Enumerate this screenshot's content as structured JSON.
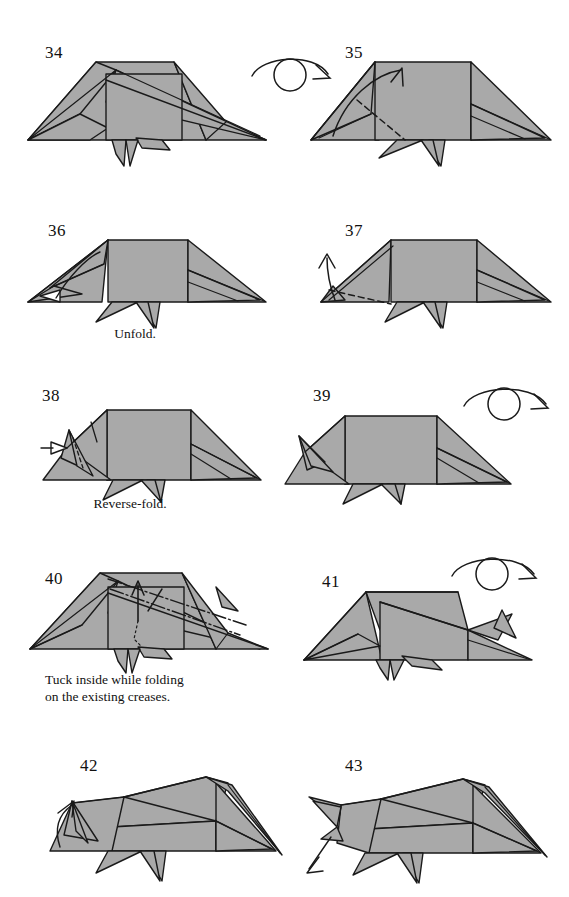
{
  "page": {
    "type": "origami-instruction-diagram",
    "model": "folded paper figure (side view)",
    "background_color": "#ffffff",
    "paper_fill_color": "#a9a9a9",
    "paper_shadow_color": "#8e8e8e",
    "line_color": "#1a1a1a",
    "text_color": "#111111",
    "columns": 2,
    "rows": 5
  },
  "steps": [
    {
      "number": "34",
      "number_pos": {
        "x": 45,
        "y": 44
      },
      "caption": "",
      "caption_pos": {
        "x": 0,
        "y": 0
      },
      "has_turnover_symbol": false,
      "figure_pos": {
        "x": 20,
        "y": 48
      },
      "figure_size": {
        "w": 250,
        "h": 120
      }
    },
    {
      "number": "35",
      "number_pos": {
        "x": 345,
        "y": 44
      },
      "caption": "",
      "caption_pos": {
        "x": 0,
        "y": 0
      },
      "has_turnover_symbol": true,
      "turnover_pos": {
        "x": 248,
        "y": 48
      },
      "figure_pos": {
        "x": 305,
        "y": 48
      },
      "figure_size": {
        "w": 250,
        "h": 120
      }
    },
    {
      "number": "36",
      "number_pos": {
        "x": 48,
        "y": 222
      },
      "caption": "Unfold.",
      "caption_pos": {
        "x": 85,
        "y": 326
      },
      "has_turnover_symbol": false,
      "figure_pos": {
        "x": 20,
        "y": 228
      },
      "figure_size": {
        "w": 250,
        "h": 100
      }
    },
    {
      "number": "37",
      "number_pos": {
        "x": 345,
        "y": 222
      },
      "caption": "",
      "caption_pos": {
        "x": 0,
        "y": 0
      },
      "has_turnover_symbol": false,
      "figure_pos": {
        "x": 305,
        "y": 228
      },
      "figure_size": {
        "w": 250,
        "h": 100
      }
    },
    {
      "number": "38",
      "number_pos": {
        "x": 42,
        "y": 387
      },
      "caption": "Reverse-fold.",
      "caption_pos": {
        "x": 60,
        "y": 496
      },
      "has_turnover_symbol": false,
      "figure_pos": {
        "x": 15,
        "y": 392
      },
      "figure_size": {
        "w": 255,
        "h": 110
      }
    },
    {
      "number": "39",
      "number_pos": {
        "x": 313,
        "y": 387
      },
      "caption": "",
      "caption_pos": {
        "x": 0,
        "y": 0
      },
      "has_turnover_symbol": true,
      "turnover_pos": {
        "x": 458,
        "y": 380
      },
      "figure_pos": {
        "x": 285,
        "y": 392
      },
      "figure_size": {
        "w": 260,
        "h": 110
      }
    },
    {
      "number": "40",
      "number_pos": {
        "x": 45,
        "y": 570
      },
      "caption": "Tuck inside while folding\non the existing creases.",
      "caption_pos": {
        "x": 45,
        "y": 672
      },
      "has_turnover_symbol": false,
      "figure_pos": {
        "x": 20,
        "y": 563
      },
      "figure_size": {
        "w": 255,
        "h": 110
      }
    },
    {
      "number": "41",
      "number_pos": {
        "x": 322,
        "y": 573
      },
      "caption": "",
      "caption_pos": {
        "x": 0,
        "y": 0
      },
      "has_turnover_symbol": true,
      "turnover_pos": {
        "x": 448,
        "y": 550
      },
      "figure_pos": {
        "x": 292,
        "y": 568
      },
      "figure_size": {
        "w": 260,
        "h": 110
      }
    },
    {
      "number": "42",
      "number_pos": {
        "x": 80,
        "y": 757
      },
      "caption": "",
      "caption_pos": {
        "x": 0,
        "y": 0
      },
      "has_turnover_symbol": false,
      "figure_pos": {
        "x": 20,
        "y": 755
      },
      "figure_size": {
        "w": 265,
        "h": 125
      }
    },
    {
      "number": "43",
      "number_pos": {
        "x": 345,
        "y": 757
      },
      "caption": "",
      "caption_pos": {
        "x": 0,
        "y": 0
      },
      "has_turnover_symbol": false,
      "figure_pos": {
        "x": 295,
        "y": 755
      },
      "figure_size": {
        "w": 265,
        "h": 125
      }
    }
  ],
  "symbols": {
    "turnover_label": "turn-over-symbol",
    "valley_fold_label": "valley-fold-dashed-line",
    "mountain_fold_label": "mountain-fold-dash-dot-line",
    "fold_arrow_label": "fold-direction-arrow",
    "push_arrow_label": "push-in-hollow-arrow"
  }
}
